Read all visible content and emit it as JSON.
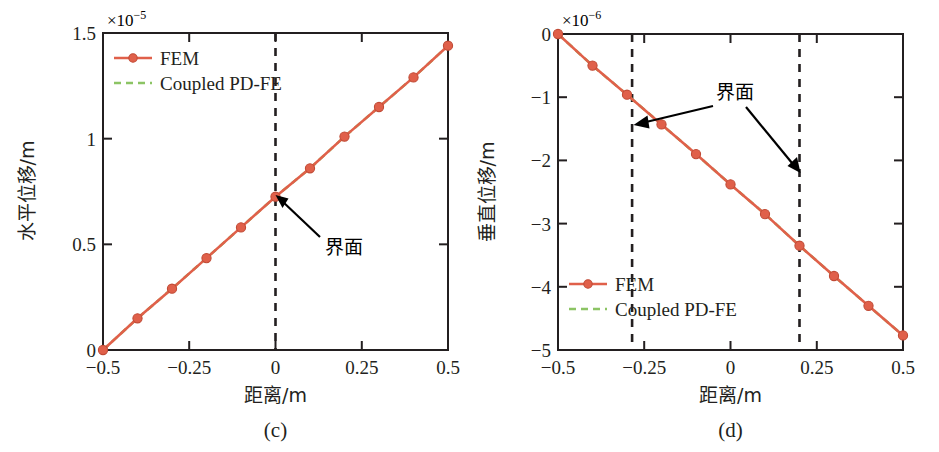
{
  "figure": {
    "panels": [
      {
        "id": "c",
        "caption": "(c)",
        "exponent_label": "×10",
        "exponent_sup": "-5",
        "xlabel": "距离/m",
        "ylabel": "水平位移/m",
        "xticks": [
          "−0.5",
          "−0.25",
          "0",
          "0.25",
          "0.5"
        ],
        "yticks": [
          "0",
          "0.5",
          "1",
          "1.5"
        ],
        "annotation": "界面",
        "legend": [
          {
            "label": "FEM",
            "style": "solid-marker",
            "color": "#e0604a"
          },
          {
            "label": "Coupled PD-FE",
            "style": "dashed",
            "color": "#8cc464"
          }
        ]
      },
      {
        "id": "d",
        "caption": "(d)",
        "exponent_label": "×10",
        "exponent_sup": "-6",
        "xlabel": "距离/m",
        "ylabel": "垂直位移/m",
        "xticks": [
          "−0.5",
          "−0.25",
          "0",
          "0.25",
          "0.5"
        ],
        "yticks": [
          "0",
          "−1",
          "−2",
          "−3",
          "−4",
          "−5"
        ],
        "annotation": "界面",
        "legend": [
          {
            "label": "FEM",
            "style": "solid-marker",
            "color": "#e0604a"
          },
          {
            "label": "Coupled PD-FE",
            "style": "dashed",
            "color": "#8cc464"
          }
        ]
      }
    ]
  },
  "colors": {
    "fem_red": "#e0604a",
    "pdfe_green": "#8cc464",
    "axis_black": "#231f20",
    "annotation_black": "#000000"
  },
  "chart_data": [
    {
      "type": "line",
      "title": "(c)",
      "xlabel": "距离/m",
      "ylabel": "水平位移/m",
      "y_exponent": "×10^-5",
      "xlim": [
        -0.5,
        0.5
      ],
      "ylim": [
        0,
        1.5
      ],
      "xticks": [
        -0.5,
        -0.25,
        0,
        0.25,
        0.5
      ],
      "yticks": [
        0,
        0.5,
        1,
        1.5
      ],
      "grid": false,
      "legend_position": "top-left",
      "x": [
        -0.5,
        -0.4,
        -0.3,
        -0.2,
        -0.1,
        0,
        0.1,
        0.2,
        0.3,
        0.4,
        0.5
      ],
      "series": [
        {
          "name": "FEM",
          "color": "#e0604a",
          "style": "solid",
          "marker": "circle",
          "values": [
            0.0,
            0.15,
            0.29,
            0.435,
            0.58,
            0.725,
            0.86,
            1.01,
            1.15,
            1.29,
            1.44
          ]
        },
        {
          "name": "Coupled PD-FE",
          "color": "#8cc464",
          "style": "dashed",
          "marker": "none",
          "values": [
            0.0,
            0.15,
            0.29,
            0.435,
            0.58,
            0.725,
            0.86,
            1.01,
            1.15,
            1.29,
            1.44
          ]
        }
      ],
      "vlines": [
        {
          "x": 0,
          "style": "dashed",
          "color": "#231f20"
        }
      ],
      "annotations": [
        {
          "text": "界面",
          "points_to_x": 0,
          "points_to_y": 0.725,
          "label_x": 0.17,
          "label_y": 0.45
        }
      ]
    },
    {
      "type": "line",
      "title": "(d)",
      "xlabel": "距离/m",
      "ylabel": "垂直位移/m",
      "y_exponent": "×10^-6",
      "xlim": [
        -0.5,
        0.5
      ],
      "ylim": [
        -5,
        0
      ],
      "xticks": [
        -0.5,
        -0.25,
        0,
        0.25,
        0.5
      ],
      "yticks": [
        0,
        -1,
        -2,
        -3,
        -4,
        -5
      ],
      "grid": false,
      "legend_position": "bottom-left",
      "x": [
        -0.5,
        -0.4,
        -0.3,
        -0.2,
        -0.1,
        0,
        0.1,
        0.2,
        0.3,
        0.4,
        0.5
      ],
      "series": [
        {
          "name": "FEM",
          "color": "#e0604a",
          "style": "solid",
          "marker": "circle",
          "values": [
            0.0,
            -0.5,
            -0.96,
            -1.43,
            -1.9,
            -2.38,
            -2.85,
            -3.35,
            -3.83,
            -4.3,
            -4.77
          ]
        },
        {
          "name": "Coupled PD-FE",
          "color": "#8cc464",
          "style": "dashed",
          "marker": "none",
          "values": [
            0.0,
            -0.5,
            -0.96,
            -1.43,
            -1.9,
            -2.38,
            -2.85,
            -3.35,
            -3.83,
            -4.3,
            -4.77
          ]
        }
      ],
      "vlines": [
        {
          "x": -0.21,
          "style": "dashed",
          "color": "#231f20"
        },
        {
          "x": 0.2,
          "style": "dashed",
          "color": "#231f20"
        }
      ],
      "annotations": [
        {
          "text": "界面",
          "points_to_x": -0.21,
          "points_to_y": -1.43,
          "label_x": 0.02,
          "label_y": -0.62
        },
        {
          "text": "",
          "points_to_x": 0.2,
          "points_to_y": -2.1,
          "label_x": 0.02,
          "label_y": -0.62
        }
      ]
    }
  ]
}
